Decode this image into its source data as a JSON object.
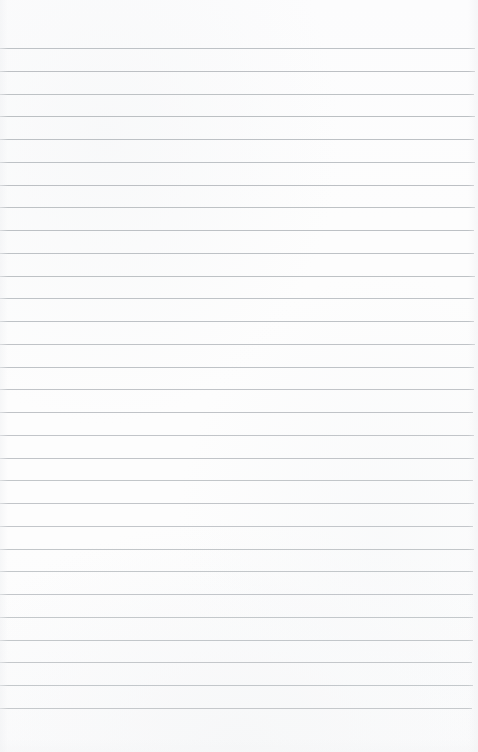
{
  "document": {
    "kind": "ruled-notebook-paper",
    "title": "Blank ruled paper sheet",
    "page_width": 478,
    "page_height": 752,
    "paper_color": "#fdfdfd",
    "content_text": "",
    "is_blank": true
  },
  "ruling": {
    "line_color": "#b9bdc1",
    "line_count": 30,
    "first_line_y": 48,
    "line_spacing": 22.7,
    "line_thickness": 1,
    "line_left_inset": 0,
    "line_right_inset": 4,
    "orientation": "horizontal",
    "lines": [
      {
        "index": 1,
        "y": 48,
        "opacity": 0.92,
        "right_inset": 3
      },
      {
        "index": 2,
        "y": 71,
        "opacity": 0.95,
        "right_inset": 3
      },
      {
        "index": 3,
        "y": 94,
        "opacity": 0.93,
        "right_inset": 4
      },
      {
        "index": 4,
        "y": 116,
        "opacity": 0.96,
        "right_inset": 3
      },
      {
        "index": 5,
        "y": 139,
        "opacity": 0.94,
        "right_inset": 4
      },
      {
        "index": 6,
        "y": 162,
        "opacity": 0.92,
        "right_inset": 3
      },
      {
        "index": 7,
        "y": 185,
        "opacity": 0.95,
        "right_inset": 4
      },
      {
        "index": 8,
        "y": 207,
        "opacity": 0.93,
        "right_inset": 3
      },
      {
        "index": 9,
        "y": 230,
        "opacity": 0.94,
        "right_inset": 4
      },
      {
        "index": 10,
        "y": 253,
        "opacity": 0.92,
        "right_inset": 4
      },
      {
        "index": 11,
        "y": 276,
        "opacity": 0.93,
        "right_inset": 3
      },
      {
        "index": 12,
        "y": 298,
        "opacity": 0.91,
        "right_inset": 4
      },
      {
        "index": 13,
        "y": 321,
        "opacity": 0.92,
        "right_inset": 4
      },
      {
        "index": 14,
        "y": 344,
        "opacity": 0.9,
        "right_inset": 3
      },
      {
        "index": 15,
        "y": 367,
        "opacity": 0.91,
        "right_inset": 4
      },
      {
        "index": 16,
        "y": 389,
        "opacity": 0.89,
        "right_inset": 4
      },
      {
        "index": 17,
        "y": 412,
        "opacity": 0.9,
        "right_inset": 5
      },
      {
        "index": 18,
        "y": 435,
        "opacity": 0.88,
        "right_inset": 4
      },
      {
        "index": 19,
        "y": 458,
        "opacity": 0.89,
        "right_inset": 4
      },
      {
        "index": 20,
        "y": 480,
        "opacity": 0.87,
        "right_inset": 5
      },
      {
        "index": 21,
        "y": 503,
        "opacity": 0.88,
        "right_inset": 4
      },
      {
        "index": 22,
        "y": 526,
        "opacity": 0.86,
        "right_inset": 5
      },
      {
        "index": 23,
        "y": 549,
        "opacity": 0.87,
        "right_inset": 4
      },
      {
        "index": 24,
        "y": 571,
        "opacity": 0.85,
        "right_inset": 5
      },
      {
        "index": 25,
        "y": 594,
        "opacity": 0.86,
        "right_inset": 5
      },
      {
        "index": 26,
        "y": 617,
        "opacity": 0.84,
        "right_inset": 5
      },
      {
        "index": 27,
        "y": 640,
        "opacity": 0.85,
        "right_inset": 5
      },
      {
        "index": 28,
        "y": 662,
        "opacity": 0.83,
        "right_inset": 6
      },
      {
        "index": 29,
        "y": 685,
        "opacity": 0.84,
        "right_inset": 5
      },
      {
        "index": 30,
        "y": 708,
        "opacity": 0.82,
        "right_inset": 6
      }
    ]
  },
  "margins": {
    "top_margin_height": 48,
    "bottom_margin_height": 44,
    "top_margin_label": "",
    "bottom_margin_label": ""
  }
}
